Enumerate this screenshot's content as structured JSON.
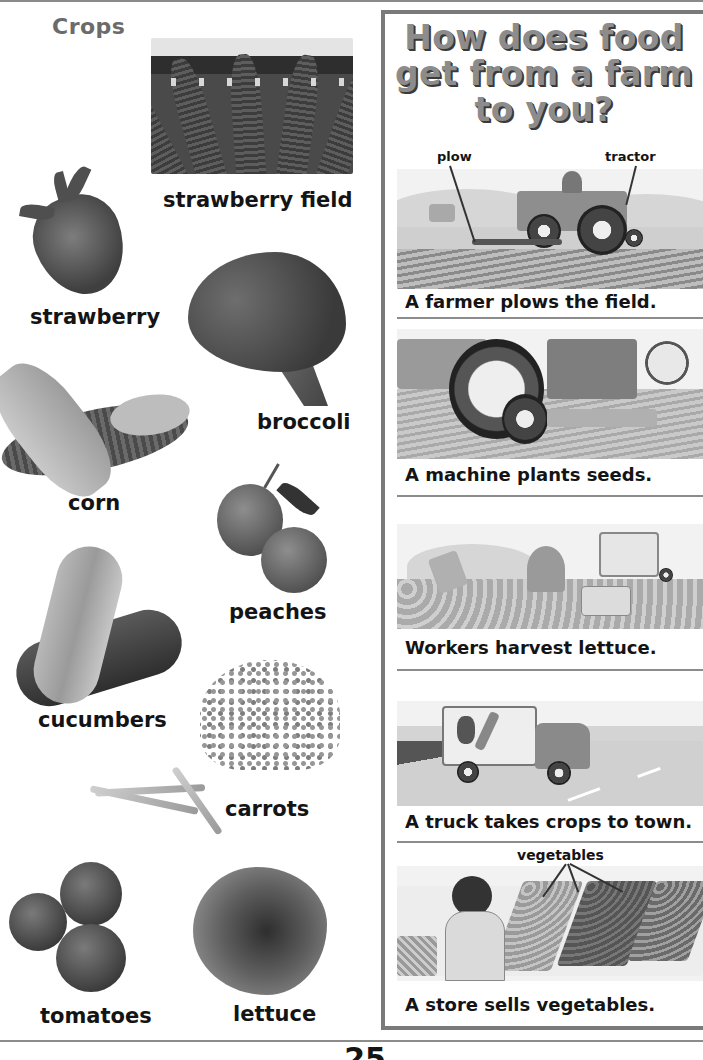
{
  "crops": {
    "title": "Crops",
    "items": [
      {
        "label": "strawberry field"
      },
      {
        "label": "strawberry"
      },
      {
        "label": "broccoli"
      },
      {
        "label": "corn"
      },
      {
        "label": "peaches"
      },
      {
        "label": "cucumbers"
      },
      {
        "label": "carrots"
      },
      {
        "label": "tomatoes"
      },
      {
        "label": "lettuce"
      }
    ]
  },
  "farm_to_you": {
    "title_lines": [
      "How does food",
      "get from a farm",
      "to you?"
    ],
    "steps": [
      {
        "caption": "A farmer plows the field.",
        "callouts": [
          "plow",
          "tractor"
        ]
      },
      {
        "caption": "A machine plants seeds.",
        "callouts": []
      },
      {
        "caption": "Workers harvest lettuce.",
        "callouts": []
      },
      {
        "caption": "A truck takes crops to town.",
        "callouts": []
      },
      {
        "caption": "A store sells vegetables.",
        "callouts": [
          "vegetables"
        ]
      }
    ]
  },
  "page": {
    "number": "25"
  },
  "colors": {
    "title_gray": "#8c8c8c",
    "crops_title_gray": "#6b6b6b",
    "panel_border": "#7a7a7a",
    "text": "#141414"
  }
}
